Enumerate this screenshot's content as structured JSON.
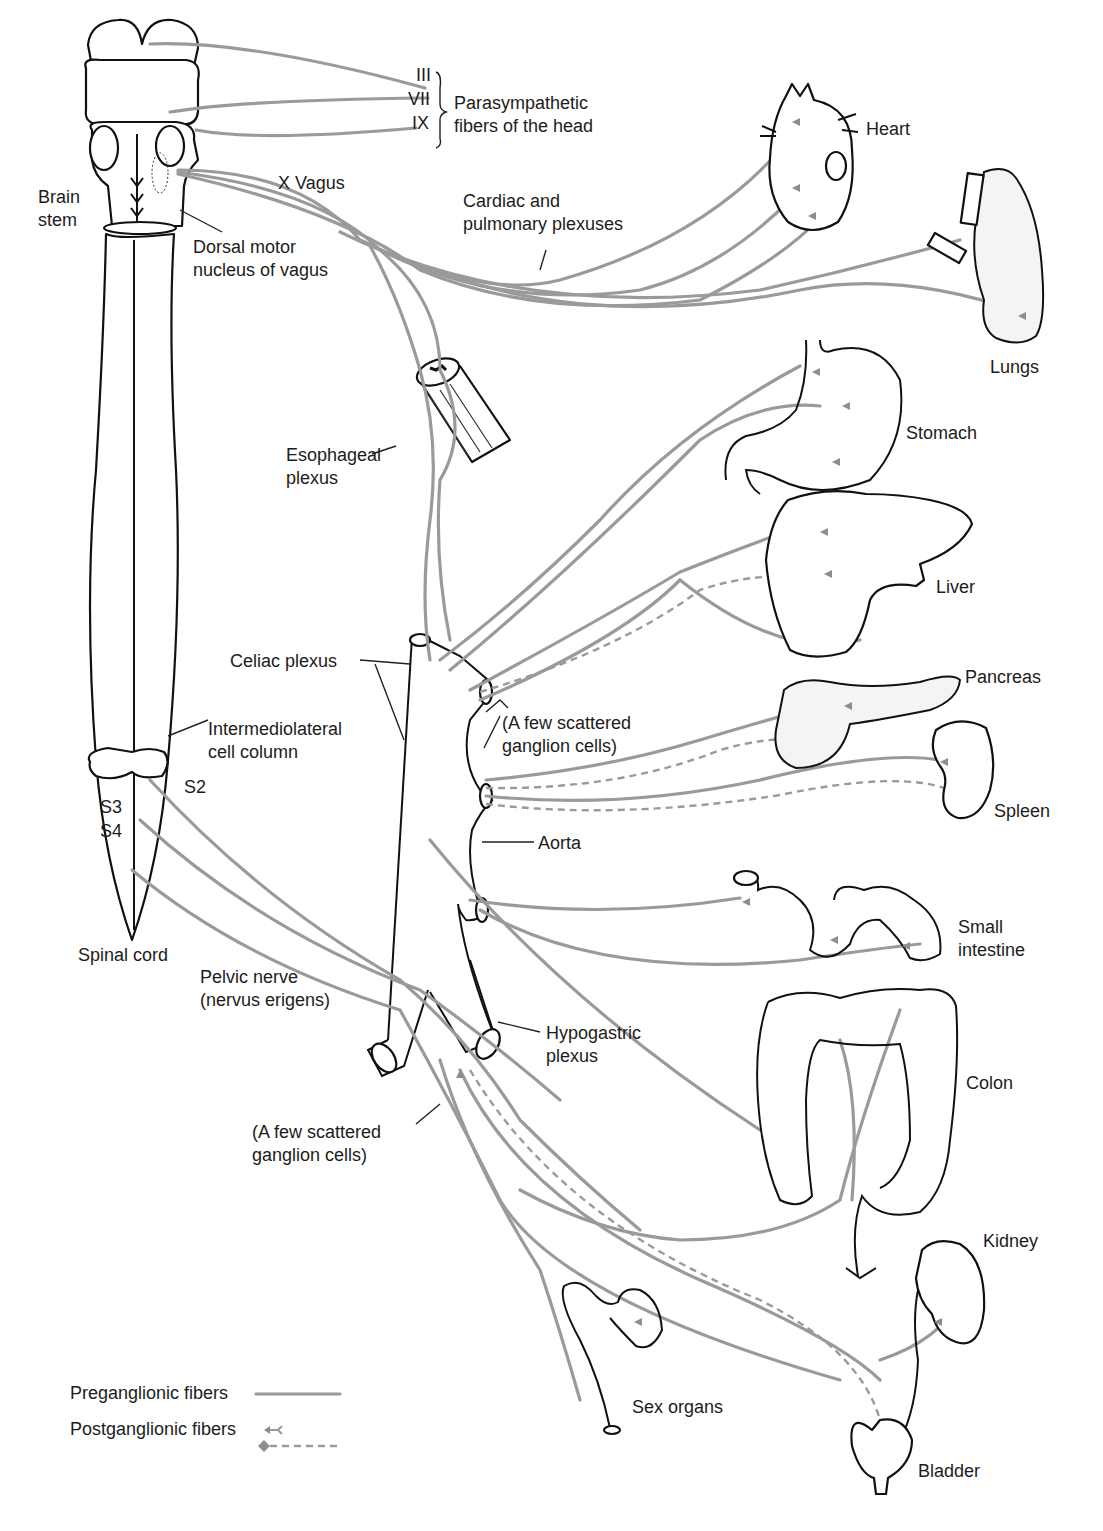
{
  "figure": {
    "colors": {
      "fiber": "#9a9a9a",
      "outline": "#111111",
      "background": "#ffffff",
      "text": "#1c1c1c"
    }
  },
  "cranial_nerves": {
    "labels": [
      "III",
      "VII",
      "IX"
    ],
    "bracket_label_line1": "Parasympathetic",
    "bracket_label_line2": "fibers of the head"
  },
  "labels": {
    "brain_stem_line1": "Brain",
    "brain_stem_line2": "stem",
    "x_vagus": "X Vagus",
    "dorsal_motor_line1": "Dorsal motor",
    "dorsal_motor_line2": "nucleus of vagus",
    "cardiac_line1": "Cardiac and",
    "cardiac_line2": "pulmonary plexuses",
    "esophageal_line1": "Esophageal",
    "esophageal_line2": "plexus",
    "celiac_plexus": "Celiac plexus",
    "intermediolateral_line1": "Intermediolateral",
    "intermediolateral_line2": "cell column",
    "s2": "S2",
    "s3": "S3",
    "s4": "S4",
    "scattered_upper_line1": "(A few scattered",
    "scattered_upper_line2": "ganglion cells)",
    "aorta": "Aorta",
    "spinal_cord": "Spinal cord",
    "pelvic_line1": "Pelvic nerve",
    "pelvic_line2": "(nervus erigens)",
    "hypogastric_line1": "Hypogastric",
    "hypogastric_line2": "plexus",
    "scattered_lower_line1": "(A few scattered",
    "scattered_lower_line2": "ganglion cells)"
  },
  "organs": [
    {
      "id": "heart",
      "label": "Heart"
    },
    {
      "id": "lungs",
      "label": "Lungs"
    },
    {
      "id": "stomach",
      "label": "Stomach"
    },
    {
      "id": "liver",
      "label": "Liver"
    },
    {
      "id": "pancreas",
      "label": "Pancreas"
    },
    {
      "id": "spleen",
      "label": "Spleen"
    },
    {
      "id": "small_intestine",
      "label_line1": "Small",
      "label_line2": "intestine"
    },
    {
      "id": "colon",
      "label": "Colon"
    },
    {
      "id": "kidney",
      "label": "Kidney"
    },
    {
      "id": "sex_organs",
      "label": "Sex organs"
    },
    {
      "id": "bladder",
      "label": "Bladder"
    }
  ],
  "legend": {
    "preganglionic": "Preganglionic fibers",
    "postganglionic": "Postganglionic fibers"
  }
}
